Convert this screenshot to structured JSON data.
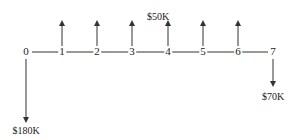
{
  "diagram": {
    "type": "cash-flow",
    "periods": [
      "0",
      "1",
      "2",
      "3",
      "4",
      "5",
      "6",
      "7"
    ],
    "inflow_label": "$50K",
    "inflow_periods": [
      1,
      2,
      3,
      4,
      5,
      6
    ],
    "outflows": [
      {
        "period": 0,
        "label": "$180K"
      },
      {
        "period": 7,
        "label": "$70K"
      }
    ],
    "line_color": "#333333"
  }
}
